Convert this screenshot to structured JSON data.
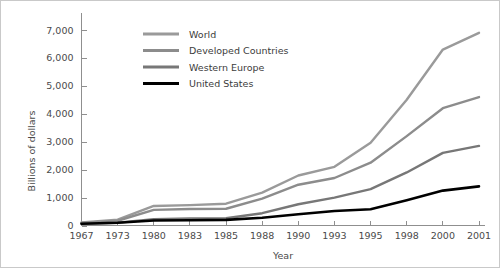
{
  "chart_data": {
    "type": "line",
    "title": "",
    "xlabel": "Year",
    "ylabel": "Billions of dollars",
    "x": [
      "1967",
      "1973",
      "1980",
      "1983",
      "1985",
      "1988",
      "1990",
      "1993",
      "1995",
      "1998",
      "2000",
      "2001"
    ],
    "categories": [
      "1967",
      "1973",
      "1980",
      "1983",
      "1985",
      "1988",
      "1990",
      "1993",
      "1995",
      "1998",
      "2000",
      "2001"
    ],
    "ylim": [
      0,
      7000
    ],
    "yticks": [
      0,
      1000,
      2000,
      3000,
      4000,
      5000,
      6000,
      7000
    ],
    "ytick_labels": [
      "0",
      "1,000",
      "2,000",
      "3,000",
      "4,000",
      "5,000",
      "6,000",
      "7,000"
    ],
    "grid": false,
    "legend_position": "upper-left-inside",
    "series": [
      {
        "name": "World",
        "color": "#9a9a9a",
        "values": [
          110,
          210,
          700,
          730,
          780,
          1180,
          1790,
          2100,
          2960,
          4500,
          6300,
          6900
        ]
      },
      {
        "name": "Developed Countries",
        "color": "#8c8c8c",
        "values": [
          95,
          170,
          560,
          590,
          600,
          960,
          1460,
          1700,
          2250,
          3200,
          4200,
          4600
        ]
      },
      {
        "name": "Western Europe",
        "color": "#777777",
        "values": [
          60,
          100,
          230,
          250,
          260,
          440,
          760,
          1000,
          1300,
          1900,
          2600,
          2850
        ]
      },
      {
        "name": "United States",
        "color": "#000000",
        "values": [
          60,
          100,
          180,
          190,
          200,
          280,
          400,
          520,
          580,
          900,
          1250,
          1400
        ]
      }
    ]
  }
}
